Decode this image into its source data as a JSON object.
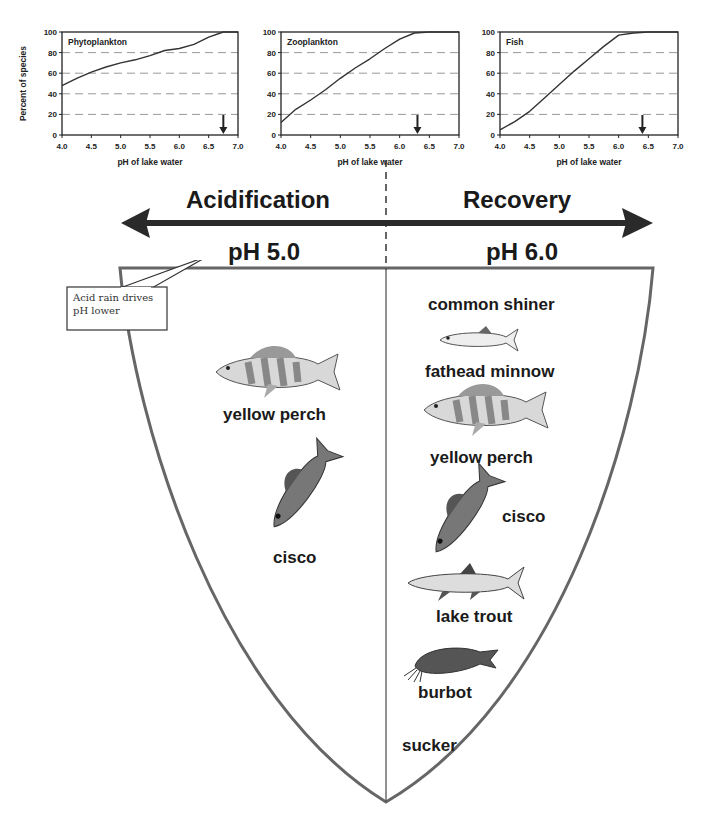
{
  "chart_data": [
    {
      "type": "line",
      "title": "Phytoplankton",
      "xlabel": "pH of lake water",
      "ylabel": "Percent of species",
      "xlim": [
        4.0,
        7.0
      ],
      "ylim": [
        0,
        100
      ],
      "x_ticks": [
        "4.0",
        "4.5",
        "5.0",
        "5.5",
        "6.0",
        "6.5",
        "7.0"
      ],
      "y_ticks": [
        "0",
        "20",
        "40",
        "60",
        "80",
        "100"
      ],
      "grid": "dashed horizontal at 20,40,60,80",
      "x": [
        4.0,
        4.25,
        4.5,
        4.75,
        5.0,
        5.25,
        5.5,
        5.75,
        6.0,
        6.25,
        6.5,
        6.75,
        7.0
      ],
      "values": [
        48,
        55,
        61,
        66,
        70,
        73,
        77,
        82,
        84,
        88,
        95,
        100,
        100
      ],
      "annotation": {
        "type": "down-arrow",
        "x": 6.75
      }
    },
    {
      "type": "line",
      "title": "Zooplankton",
      "xlabel": "pH of lake water",
      "ylabel": "",
      "xlim": [
        4.0,
        7.0
      ],
      "ylim": [
        0,
        100
      ],
      "x_ticks": [
        "4.0",
        "4.5",
        "5.0",
        "5.5",
        "6.0",
        "6.5",
        "7.0"
      ],
      "y_ticks": [
        "0",
        "20",
        "40",
        "60",
        "80",
        "100"
      ],
      "grid": "dashed horizontal at 20,40,60,80",
      "x": [
        4.0,
        4.25,
        4.5,
        4.75,
        5.0,
        5.25,
        5.5,
        5.75,
        6.0,
        6.25,
        6.5,
        6.75,
        7.0
      ],
      "values": [
        12,
        25,
        34,
        44,
        55,
        65,
        74,
        84,
        93,
        99,
        100,
        100,
        100
      ],
      "annotation": {
        "type": "down-arrow",
        "x": 6.3
      }
    },
    {
      "type": "line",
      "title": "Fish",
      "xlabel": "pH of lake water",
      "ylabel": "",
      "xlim": [
        4.0,
        7.0
      ],
      "ylim": [
        0,
        100
      ],
      "x_ticks": [
        "4.0",
        "4.5",
        "5.0",
        "5.5",
        "6.0",
        "6.5",
        "7.0"
      ],
      "y_ticks": [
        "0",
        "20",
        "40",
        "60",
        "80",
        "100"
      ],
      "grid": "dashed horizontal at 20,40,60,80",
      "x": [
        4.0,
        4.25,
        4.5,
        4.75,
        5.0,
        5.25,
        5.5,
        5.75,
        6.0,
        6.25,
        6.5,
        6.75,
        7.0
      ],
      "values": [
        5,
        13,
        23,
        36,
        49,
        62,
        74,
        86,
        97,
        99,
        100,
        100,
        100
      ],
      "annotation": {
        "type": "down-arrow",
        "x": 6.4
      }
    }
  ],
  "labels": {
    "acidification": "Acidification",
    "recovery": "Recovery",
    "ph_left": "pH 5.0",
    "ph_right": "pH 6.0",
    "callout": "Acid rain drives pH lower"
  },
  "left_species": [
    {
      "name": "yellow perch",
      "icon": "perch"
    },
    {
      "name": "cisco",
      "icon": "cisco"
    }
  ],
  "right_species": [
    {
      "name": "common shiner",
      "icon": null
    },
    {
      "name": "fathead minnow",
      "icon": "minnow"
    },
    {
      "name": "yellow perch",
      "icon": "perch"
    },
    {
      "name": "cisco",
      "icon": "cisco"
    },
    {
      "name": "lake trout",
      "icon": "trout"
    },
    {
      "name": "burbot",
      "icon": "burbot"
    },
    {
      "name": "sucker",
      "icon": null
    }
  ],
  "colors": {
    "ink": "#1a1a1a",
    "bowl": "#666666",
    "grid": "#999999",
    "arrow": "#2a2a2a"
  }
}
